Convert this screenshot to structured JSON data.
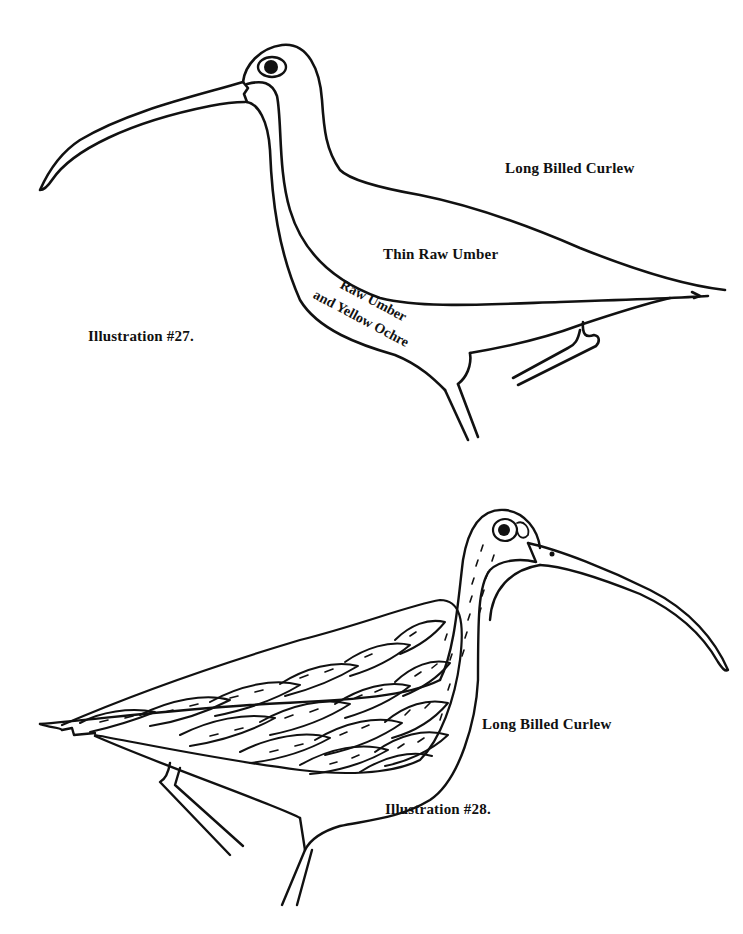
{
  "page": {
    "background": "#ffffff",
    "ink": "#111111"
  },
  "illustration_27": {
    "caption": "Illustration #27.",
    "title": "Long Billed Curlew",
    "annotations": {
      "body": "Thin Raw Umber",
      "neck_line1": "Raw Umber",
      "neck_line2": "and Yellow Ochre"
    }
  },
  "illustration_28": {
    "caption": "Illustration #28.",
    "title": "Long Billed Curlew"
  }
}
